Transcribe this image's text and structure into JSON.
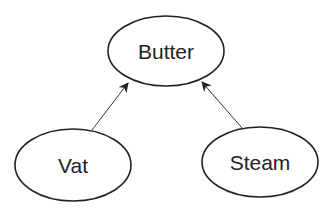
{
  "diagram": {
    "type": "directed-graph",
    "nodes": [
      {
        "id": "butter",
        "label": "Butter",
        "shape": "ellipse",
        "cx": 166,
        "cy": 51,
        "rx": 58,
        "ry": 35
      },
      {
        "id": "vat",
        "label": "Vat",
        "shape": "ellipse",
        "cx": 73,
        "cy": 165,
        "rx": 58,
        "ry": 36
      },
      {
        "id": "steam",
        "label": "Steam",
        "shape": "ellipse",
        "cx": 260,
        "cy": 162,
        "rx": 58,
        "ry": 35
      }
    ],
    "edges": [
      {
        "from": "vat",
        "to": "butter",
        "x1": 92,
        "y1": 130,
        "x2": 128,
        "y2": 83
      },
      {
        "from": "steam",
        "to": "butter",
        "x1": 242,
        "y1": 128,
        "x2": 202,
        "y2": 82
      }
    ],
    "colors": {
      "stroke": "#222222",
      "background": "#ffffff"
    }
  }
}
